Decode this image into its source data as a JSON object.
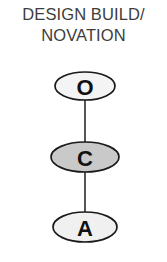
{
  "page": {
    "background_color": "#ffffff",
    "width": 167,
    "height": 262
  },
  "title": {
    "line1": "DESIGN BUILD/",
    "line2": "NOVATION",
    "full_text": "DESIGN BUILD/NOVATION",
    "color": "#3d3d3d"
  },
  "diagram": {
    "type": "vertical-chain",
    "outline_color": "#1a1a1a",
    "connector_color": "#2b2b2b",
    "nodes": [
      {
        "id": "owner",
        "label": "O",
        "fill_color": "#f4f4f4",
        "cx": 85,
        "cy": 86,
        "rx": 30,
        "ry": 14
      },
      {
        "id": "contractor",
        "label": "C",
        "fill_color": "#c9c9c9",
        "cx": 85,
        "cy": 157,
        "rx": 34,
        "ry": 15
      },
      {
        "id": "architect",
        "label": "A",
        "fill_color": "#f0f0f0",
        "cx": 85,
        "cy": 227,
        "rx": 32,
        "ry": 15
      }
    ],
    "connectors": [
      {
        "id": "owner-to-contractor",
        "from": "owner",
        "to": "contractor",
        "x": 85,
        "y1": 100,
        "y2": 142
      },
      {
        "id": "contractor-to-architect",
        "from": "contractor",
        "to": "architect",
        "x": 85,
        "y1": 172,
        "y2": 212
      }
    ]
  }
}
